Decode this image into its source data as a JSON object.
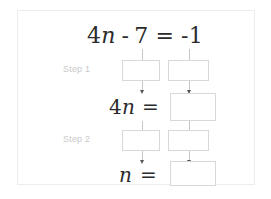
{
  "card": {
    "background": "#ffffff",
    "border_color": "#ededed"
  },
  "colors": {
    "equation_text": "#2b2b2b",
    "step_label": "#c9c9c9",
    "box_border": "#d8d8d8",
    "connector": "#c6c6c6",
    "arrow": "#555555"
  },
  "equation": {
    "coefficient": "4",
    "variable": "n",
    "operator": "-",
    "constant": "7",
    "equals": "=",
    "right_side": "-1",
    "full_text": "4n - 7 = -1"
  },
  "steps": [
    {
      "label": "Step 1"
    },
    {
      "label": "Step 2"
    }
  ],
  "rows": {
    "row_step1": {
      "label": "Step 1",
      "boxes": [
        {
          "name": "step1-left-box",
          "value": ""
        },
        {
          "name": "step1-right-box",
          "value": ""
        }
      ]
    },
    "row_result1": {
      "lhs_coefficient": "4",
      "lhs_variable": "n",
      "equals": "=",
      "answer": ""
    },
    "row_step2": {
      "label": "Step 2",
      "boxes": [
        {
          "name": "step2-left-box",
          "value": ""
        },
        {
          "name": "step2-right-box",
          "value": ""
        }
      ]
    },
    "row_result2": {
      "lhs_variable": "n",
      "equals": "=",
      "answer": ""
    }
  }
}
